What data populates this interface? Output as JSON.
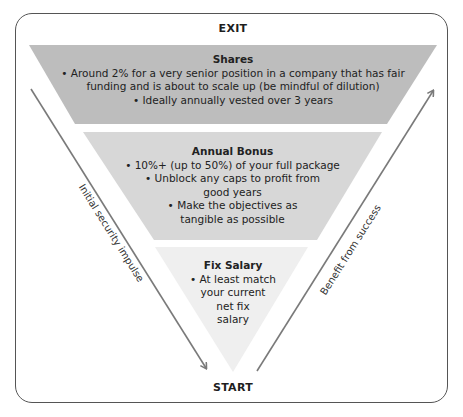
{
  "diagram": {
    "type": "inverted-funnel",
    "exit_label": "EXIT",
    "start_label": "START",
    "layers": [
      {
        "id": "shares",
        "title": "Shares",
        "bullets": [
          "• Around 2% for a very senior position in a company that has fair",
          "funding and is about to scale up (be mindful of dilution)",
          "• Ideally annually vested over 3 years"
        ],
        "color": "#bdbdbd"
      },
      {
        "id": "annual-bonus",
        "title": "Annual Bonus",
        "bullets": [
          "• 10%+ (up to 50%) of your full package",
          "• Unblock any caps to profit from",
          "good years",
          "• Make the objectives as",
          "tangible as possible"
        ],
        "color": "#d7d7d7"
      },
      {
        "id": "fix-salary",
        "title": "Fix Salary",
        "bullets": [
          "• At least match",
          "your current",
          "net fix",
          "salary"
        ],
        "color": "#efefef"
      }
    ],
    "arrows": {
      "left": {
        "label": "Initial security impulse",
        "direction": "down",
        "color": "#7a7a7a"
      },
      "right": {
        "label": "Benefit from success",
        "direction": "up",
        "color": "#7a7a7a"
      }
    },
    "frame_color": "#555555"
  },
  "caption": {
    "text": ""
  }
}
